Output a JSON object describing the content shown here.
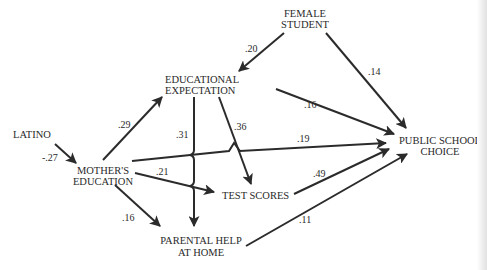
{
  "diagram": {
    "type": "path-model",
    "nodes": {
      "female_student": [
        "FEMALE",
        "STUDENT"
      ],
      "educational_expectation": [
        "EDUCATIONAL",
        "EXPECTATION"
      ],
      "latino": [
        "LATINO"
      ],
      "mothers_education": [
        "MOTHER'S",
        "EDUCATION"
      ],
      "test_scores": [
        "TEST SCORES"
      ],
      "parental_help": [
        "PARENTAL HELP",
        "AT HOME"
      ],
      "public_school_choice": [
        "PUBLIC SCHOOL",
        "CHOICE"
      ]
    },
    "edges": [
      {
        "from": "Female Student",
        "to": "Educational Expectation",
        "coef": ".20"
      },
      {
        "from": "Female Student",
        "to": "Public School Choice",
        "coef": ".14"
      },
      {
        "from": "Educational Expectation",
        "to": "Public School Choice",
        "coef": ".16"
      },
      {
        "from": "Mother's Education",
        "to": "Educational Expectation",
        "coef": ".29"
      },
      {
        "from": "Educational Expectation",
        "to": "Parental Help at Home",
        "coef": ".31"
      },
      {
        "from": "Educational Expectation",
        "to": "Test Scores",
        "coef": ".36"
      },
      {
        "from": "Latino",
        "to": "Mother's Education",
        "coef": "-.27"
      },
      {
        "from": "Mother's Education",
        "to": "Public School Choice",
        "coef": ".19"
      },
      {
        "from": "Mother's Education",
        "to": "Test Scores",
        "coef": ".21"
      },
      {
        "from": "Test Scores",
        "to": "Public School Choice",
        "coef": ".49"
      },
      {
        "from": "Mother's Education",
        "to": "Parental Help at Home",
        "coef": ".16"
      },
      {
        "from": "Parental Help at Home",
        "to": "Public School Choice",
        "coef": ".11"
      }
    ]
  },
  "coefs": {
    "fs_ee": ".20",
    "fs_psc": ".14",
    "ee_psc": ".16",
    "me_ee": ".29",
    "ee_ph": ".31",
    "ee_ts": ".36",
    "lat_me": "-.27",
    "me_psc": ".19",
    "me_ts": ".21",
    "ts_psc": ".49",
    "me_ph": ".16",
    "ph_psc": ".11"
  }
}
